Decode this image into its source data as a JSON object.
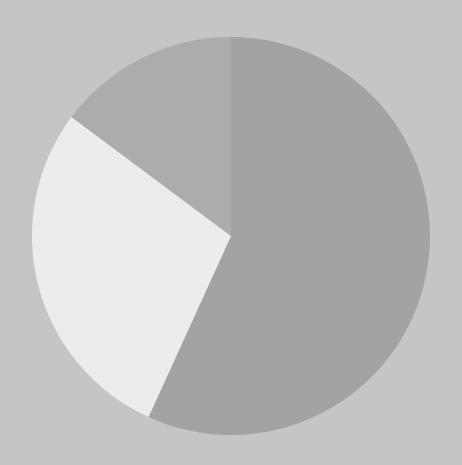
{
  "chart_data": {
    "type": "pie",
    "title": "",
    "start": "12 o'clock",
    "direction": "clockwise",
    "slices": [
      {
        "label": "",
        "value": 56.8,
        "color": "#a3a3a3"
      },
      {
        "label": "",
        "value": 28.4,
        "color": "#ececec"
      },
      {
        "label": "",
        "value": 14.8,
        "color": "#acacac"
      }
    ],
    "legend": "none",
    "background": "#c5c5c5"
  }
}
